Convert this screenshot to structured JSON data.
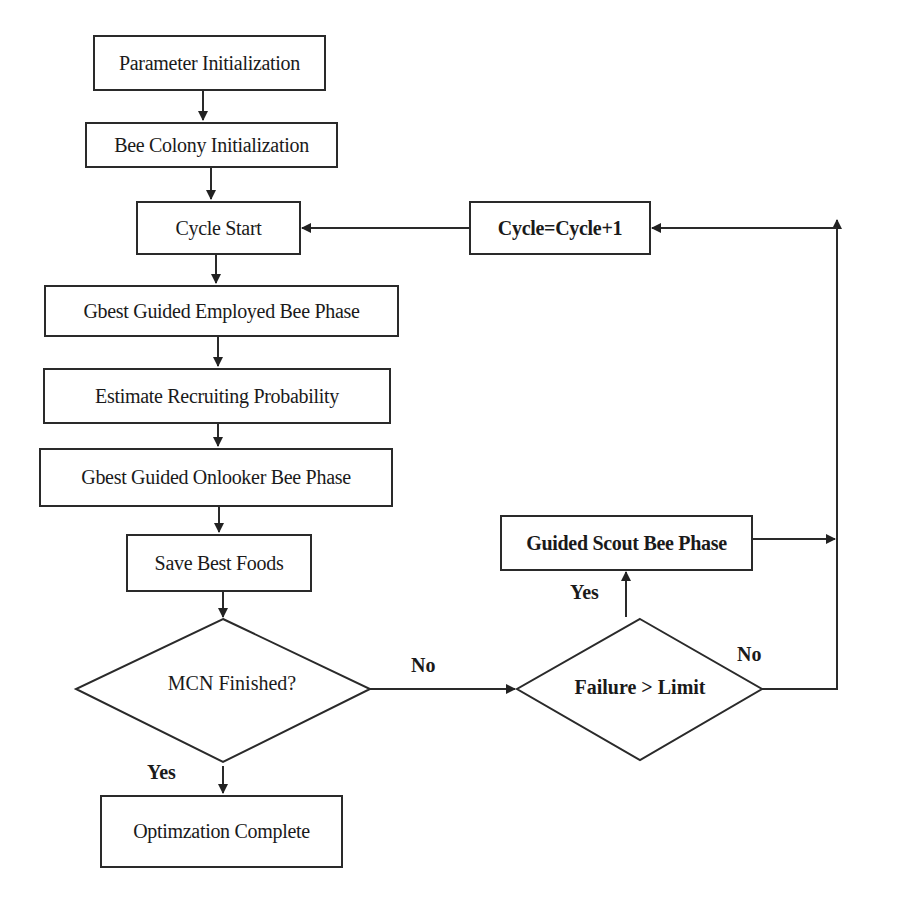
{
  "flowchart": {
    "nodes": {
      "param_init": "Parameter Initialization",
      "colony_init": "Bee Colony Initialization",
      "cycle_start": "Cycle Start",
      "cycle_inc": "Cycle=Cycle+1",
      "employed": "Gbest Guided Employed Bee Phase",
      "recruit_prob": "Estimate Recruiting Probability",
      "onlooker": "Gbest Guided Onlooker Bee Phase",
      "save_best": "Save Best Foods",
      "mcn_decision": "MCN Finished?",
      "failure_decision": "Failure > Limit",
      "scout": "Guided Scout Bee Phase",
      "complete": "Optimzation Complete"
    },
    "edge_labels": {
      "mcn_no": "No",
      "mcn_yes": "Yes",
      "failure_yes": "Yes",
      "failure_no": "No"
    }
  }
}
